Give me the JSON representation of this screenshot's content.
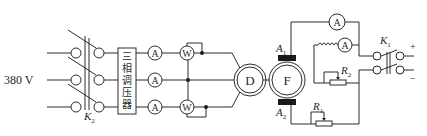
{
  "diagram": {
    "title": "",
    "supply": {
      "label": "380 V"
    },
    "switches": {
      "k2": {
        "label": "K",
        "sub": "2"
      },
      "k1": {
        "label": "K",
        "sub": "1"
      }
    },
    "transformer": {
      "label_chars": [
        "三",
        "相",
        "调",
        "压",
        "器"
      ]
    },
    "meters": {
      "ammeter_symbol": "A",
      "wattmeter_symbol": "W"
    },
    "motor": {
      "label": "D"
    },
    "generator": {
      "label": "F"
    },
    "brushes": {
      "a1": {
        "label": "A",
        "sub": "1"
      },
      "a2": {
        "label": "A",
        "sub": "2"
      }
    },
    "resistors": {
      "r1": {
        "label": "R",
        "sub": "1"
      },
      "r2": {
        "label": "R",
        "sub": "2"
      }
    },
    "terminals": {
      "plus": "+",
      "minus": "−"
    },
    "colors": {
      "line": "#2a2a2a",
      "brush": "#1a1a1a",
      "background": "#ffffff"
    }
  }
}
